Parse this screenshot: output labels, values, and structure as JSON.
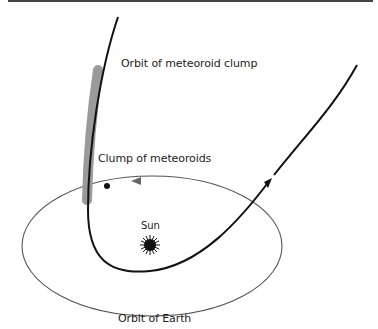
{
  "diagram": {
    "labels": {
      "meteoroid_orbit": "Orbit of meteoroid clump",
      "clump": "Clump of meteoroids",
      "sun": "Sun",
      "earth_orbit": "Orbit of Earth"
    },
    "colors": {
      "background": "#ffffff",
      "meteoroid_orbit": "#111111",
      "earth_orbit": "#555555",
      "clump_band": "#9a9a9a",
      "sun": "#111111",
      "top_rule": "#444444"
    }
  }
}
